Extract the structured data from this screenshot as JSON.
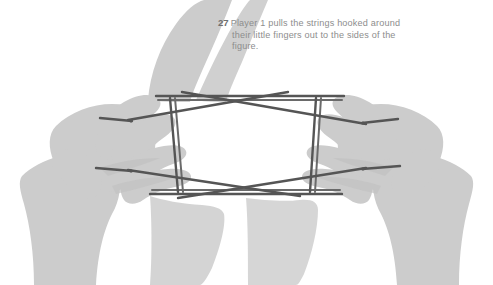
{
  "figure": {
    "step_number": "27",
    "caption": "Player 1 pulls the strings hooked around their little fingers out to the sides of the figure.",
    "colors": {
      "background": "#ffffff",
      "hand_fill": "#cccccc",
      "hand_shadow": "#c2c2c2",
      "string": "#555555",
      "string_highlight": "#7a7a7a",
      "caption_text": "#8d8d8d",
      "step_number_text": "#6f6f6f"
    },
    "elements": {
      "left_hand_label": "Player 1 left hand silhouette",
      "right_hand_label": "Player 1 right hand silhouette",
      "string_label": "looped string figure"
    }
  }
}
